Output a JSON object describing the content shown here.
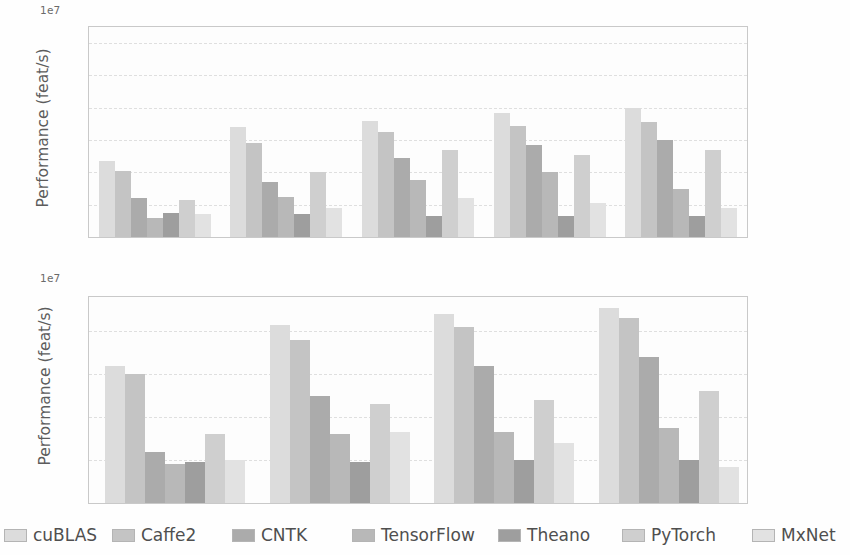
{
  "figure": {
    "background": "#fefefe",
    "offset_label": "1e7"
  },
  "legend": {
    "position": "bottom",
    "entries": [
      {
        "label": "cuBLAS",
        "color": "#dcdcdc"
      },
      {
        "label": "Caffe2",
        "color": "#c4c4c4"
      },
      {
        "label": "CNTK",
        "color": "#ababab"
      },
      {
        "label": "TensorFlow",
        "color": "#b8b8b8"
      },
      {
        "label": "Theano",
        "color": "#9e9e9e"
      },
      {
        "label": "PyTorch",
        "color": "#cfcfcf"
      },
      {
        "label": "MxNet",
        "color": "#e2e2e2"
      }
    ]
  },
  "chart_data": [
    {
      "id": "top",
      "type": "bar",
      "title": "",
      "xlabel": "",
      "ylabel": "Performance (feat/s)",
      "offset": "1e7",
      "ylim": [
        0,
        1.3
      ],
      "yticks": [
        "0.0",
        "0.2",
        "0.4",
        "0.6",
        "0.8",
        "1.0",
        "1.2"
      ],
      "ytick_values": [
        0.0,
        0.2,
        0.4,
        0.6,
        0.8,
        1.0,
        1.2
      ],
      "grid": true,
      "categories": [
        "2^11",
        "2^13",
        "2^15",
        "2^17",
        "2^19"
      ],
      "category_labels": [
        {
          "base": "2",
          "exp": "11"
        },
        {
          "base": "2",
          "exp": "13"
        },
        {
          "base": "2",
          "exp": "15"
        },
        {
          "base": "2",
          "exp": "17"
        },
        {
          "base": "2",
          "exp": "19"
        }
      ],
      "series": [
        {
          "name": "cuBLAS",
          "values": [
            0.47,
            0.68,
            0.72,
            0.77,
            0.8
          ]
        },
        {
          "name": "Caffe2",
          "values": [
            0.41,
            0.58,
            0.65,
            0.69,
            0.71
          ]
        },
        {
          "name": "CNTK",
          "values": [
            0.24,
            0.34,
            0.49,
            0.57,
            0.6
          ]
        },
        {
          "name": "TensorFlow",
          "values": [
            0.12,
            0.25,
            0.35,
            0.4,
            0.3
          ]
        },
        {
          "name": "Theano",
          "values": [
            0.15,
            0.14,
            0.13,
            0.13,
            0.13
          ]
        },
        {
          "name": "PyTorch",
          "values": [
            0.23,
            0.4,
            0.54,
            0.51,
            0.54
          ]
        },
        {
          "name": "MxNet",
          "values": [
            0.14,
            0.18,
            0.24,
            0.21,
            0.18
          ]
        }
      ]
    },
    {
      "id": "bottom",
      "type": "bar",
      "title": "",
      "xlabel": "",
      "ylabel": "Performance (feat/s)",
      "offset": "1e7",
      "ylim": [
        0,
        0.48
      ],
      "yticks": [
        "0",
        "0.1",
        "0.2",
        "0.3",
        "0.4"
      ],
      "ytick_values": [
        0.0,
        0.1,
        0.2,
        0.3,
        0.4
      ],
      "grid": true,
      "categories": [
        "2^11",
        "2^13",
        "2^15",
        "2^17"
      ],
      "category_labels": [
        {
          "base": "2",
          "exp": "11"
        },
        {
          "base": "2",
          "exp": "13"
        },
        {
          "base": "2",
          "exp": "15"
        },
        {
          "base": "2",
          "exp": "17"
        }
      ],
      "series": [
        {
          "name": "cuBLAS",
          "values": [
            0.32,
            0.415,
            0.44,
            0.455
          ]
        },
        {
          "name": "Caffe2",
          "values": [
            0.3,
            0.38,
            0.41,
            0.43
          ]
        },
        {
          "name": "CNTK",
          "values": [
            0.12,
            0.25,
            0.32,
            0.34
          ]
        },
        {
          "name": "TensorFlow",
          "values": [
            0.09,
            0.16,
            0.165,
            0.175
          ]
        },
        {
          "name": "Theano",
          "values": [
            0.095,
            0.095,
            0.1,
            0.1
          ]
        },
        {
          "name": "PyTorch",
          "values": [
            0.16,
            0.23,
            0.24,
            0.26
          ]
        },
        {
          "name": "MxNet",
          "values": [
            0.1,
            0.165,
            0.14,
            0.085
          ]
        }
      ]
    }
  ]
}
